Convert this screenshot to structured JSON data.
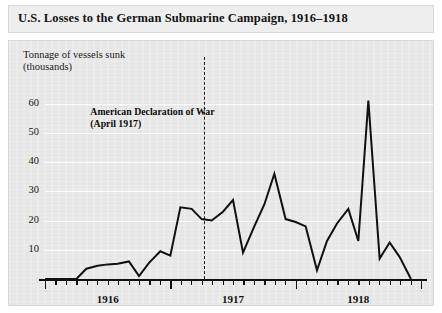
{
  "chart_data": {
    "type": "line",
    "title": "U.S. Losses to the German Submarine Campaign, 1916–1918",
    "ylabel": "Tonnage of vessels sunk\n(thousands)",
    "xlabel": "",
    "ylim": [
      0,
      65
    ],
    "yticks": [
      10,
      20,
      30,
      40,
      50,
      60
    ],
    "ytick_labels": [
      "10",
      "20",
      "30",
      "40",
      "50",
      "60"
    ],
    "grid": true,
    "legend": "none",
    "x_major_labels": [
      "1916",
      "1917",
      "1918"
    ],
    "x_major_positions": [
      1916.5,
      1917.5,
      1918.5
    ],
    "x_axis_range": [
      1916.0,
      1919.0
    ],
    "x_minor_tick_interval_months": 1,
    "annotations": [
      {
        "text": "American Declaration of War\n(April 1917)",
        "x": 1917.27,
        "style": "dashed-vertical-rule",
        "label_x": 1917.0,
        "label_y": 57
      }
    ],
    "series": [
      {
        "name": "Tonnage of vessels sunk (thousands)",
        "color": "#111111",
        "x": [
          1916.0,
          1916.08,
          1916.17,
          1916.25,
          1916.33,
          1916.42,
          1916.5,
          1916.58,
          1916.67,
          1916.75,
          1916.83,
          1916.92,
          1917.0,
          1917.08,
          1917.17,
          1917.25,
          1917.33,
          1917.42,
          1917.5,
          1917.58,
          1917.67,
          1917.75,
          1917.83,
          1917.92,
          1918.0,
          1918.08,
          1918.17,
          1918.25,
          1918.33,
          1918.42,
          1918.5,
          1918.58,
          1918.67,
          1918.75,
          1918.83,
          1918.92
        ],
        "x_labels": [
          "Jan 1916",
          "Feb 1916",
          "Mar 1916",
          "Apr 1916",
          "May 1916",
          "Jun 1916",
          "Jul 1916",
          "Aug 1916",
          "Sep 1916",
          "Oct 1916",
          "Nov 1916",
          "Dec 1916",
          "Jan 1917",
          "Feb 1917",
          "Mar 1917",
          "Apr 1917",
          "May 1917",
          "Jun 1917",
          "Jul 1917",
          "Aug 1917",
          "Sep 1917",
          "Oct 1917",
          "Nov 1917",
          "Dec 1917",
          "Jan 1918",
          "Feb 1918",
          "Mar 1918",
          "Apr 1918",
          "May 1918",
          "Jun 1918",
          "Jul 1918",
          "Aug 1918",
          "Sep 1918",
          "Oct 1918",
          "Nov 1918",
          "Dec 1918"
        ],
        "values": [
          0,
          0,
          0,
          0,
          3.5,
          4.5,
          5.0,
          5.2,
          6.0,
          1.0,
          5.5,
          9.5,
          8.0,
          24.5,
          24.0,
          20.5,
          20.0,
          23.0,
          27.0,
          9.0,
          18.0,
          25.5,
          36.0,
          20.5,
          19.5,
          18.0,
          3.0,
          13.0,
          19.0,
          24.0,
          13.0,
          61.0,
          7.0,
          12.5,
          7.5,
          0
        ]
      }
    ]
  },
  "figure": {
    "background_color": "#ffffff",
    "panel_color": "#e9e9e9",
    "title_band_color": "#eeeeee",
    "gridline_color": "#fbfbfb",
    "axis_color": "#111111",
    "line_color": "#111111"
  }
}
